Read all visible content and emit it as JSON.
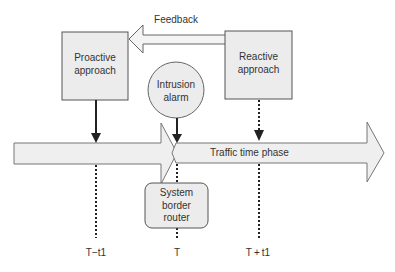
{
  "diagram": {
    "feedback_label": "Feedback",
    "proactive": {
      "line1": "Proactive",
      "line2": "approach"
    },
    "reactive": {
      "line1": "Reactive",
      "line2": "approach"
    },
    "alarm": {
      "line1": "Intrusion",
      "line2": "alarm"
    },
    "router": {
      "line1": "System",
      "line2": "border",
      "line3": "router"
    },
    "timeline_label": "Traffic time phase",
    "time_marks": [
      "T−t1",
      "T",
      "T + t1"
    ]
  },
  "colors": {
    "box_fill": "#ececec",
    "stroke": "#555555",
    "arrow_fill": "#efefef",
    "text": "#333333"
  }
}
